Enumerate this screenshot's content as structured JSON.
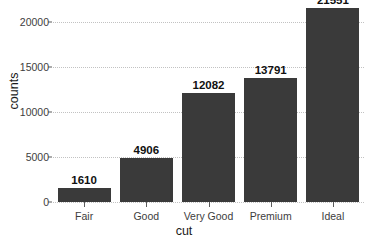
{
  "chart_data": {
    "type": "bar",
    "title": "",
    "xlabel": "cut",
    "ylabel": "counts",
    "categories": [
      "Fair",
      "Good",
      "Very Good",
      "Premium",
      "Ideal"
    ],
    "values": [
      1610,
      4906,
      12082,
      13791,
      21551
    ],
    "value_labels": [
      "1610",
      "4906",
      "12082",
      "13791",
      "21551"
    ],
    "ylim": [
      0,
      22000
    ],
    "yticks": [
      0,
      5000,
      10000,
      15000,
      20000
    ],
    "ytick_labels": [
      "0",
      "5000",
      "10000",
      "15000",
      "20000"
    ],
    "grid": true,
    "grid_axis": "y",
    "legend": "none",
    "bar_color": "#3a3a3a",
    "background_color": "#ffffff",
    "gridline_color": "#c2c2c2",
    "axis_text_color": "#3d3d3d"
  }
}
